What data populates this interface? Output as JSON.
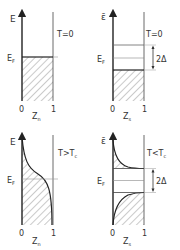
{
  "panels": [
    {
      "id": "normal-T0",
      "y_axis_label": "E",
      "fermi_label": "E",
      "fermi_sub": "F",
      "x_axis_label": "Z",
      "x_axis_sub": "n",
      "x_ticks": [
        "0",
        "1"
      ],
      "condition": "T=0"
    },
    {
      "id": "super-T0",
      "y_axis_label": "ε̄",
      "fermi_label": "E",
      "fermi_sub": "F",
      "x_axis_label": "Z",
      "x_axis_sub": "s",
      "x_ticks": [
        "0",
        "1"
      ],
      "condition": "T=0",
      "gap_label": "2Δ"
    },
    {
      "id": "normal-TgtTc",
      "y_axis_label": "E",
      "fermi_label": "E",
      "fermi_sub": "F",
      "x_axis_label": "Z",
      "x_axis_sub": "n",
      "x_ticks": [
        "0",
        "1"
      ],
      "condition_main": "T>T",
      "condition_sub": "c"
    },
    {
      "id": "super-TltTc",
      "y_axis_label": "ε̄",
      "fermi_label": "E",
      "fermi_sub": "F",
      "x_axis_label": "Z",
      "x_axis_sub": "s",
      "x_ticks": [
        "0",
        "1"
      ],
      "condition_main": "T<T",
      "condition_sub": "c",
      "gap_label": "2Δ"
    }
  ],
  "colors": {
    "line": "#333333",
    "hatch": "#555555",
    "grid": "#888888"
  }
}
